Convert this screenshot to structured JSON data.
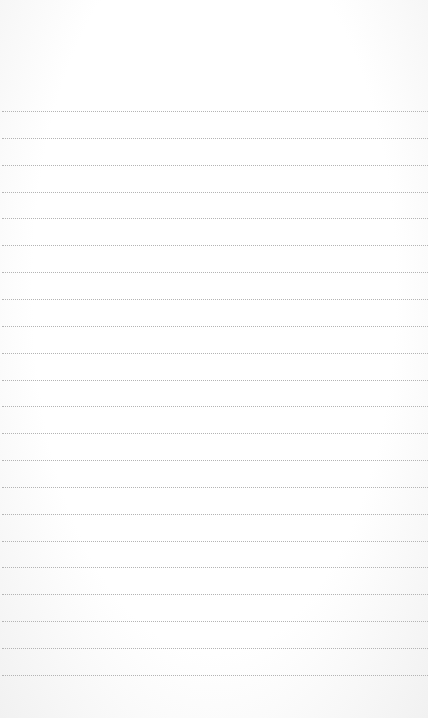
{
  "paper": {
    "background": "#ffffff",
    "line_color": "#b4b4b4",
    "line_style": "dotted",
    "first_line_y": 111,
    "line_spacing": 26.85,
    "line_count": 22
  }
}
